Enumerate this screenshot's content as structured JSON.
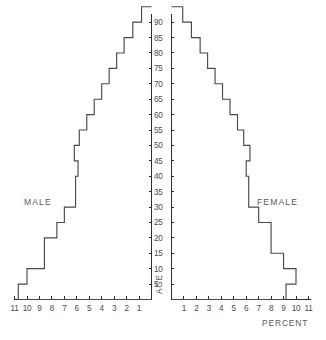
{
  "chart_data": {
    "type": "bar",
    "subtype": "population-pyramid",
    "title": "",
    "xlabel": "PERCENT",
    "ylabel": "AGE",
    "orientation": "horizontal-back-to-back",
    "grid": false,
    "legend_position": "inline-sides",
    "categories": [
      "0-4",
      "5-9",
      "10-14",
      "15-19",
      "20-24",
      "25-29",
      "30-34",
      "35-39",
      "40-44",
      "45-49",
      "50-54",
      "55-59",
      "60-64",
      "65-69",
      "70-74",
      "75-79",
      "80-84",
      "85-89",
      "90+"
    ],
    "age_band_lower_bounds": [
      0,
      5,
      10,
      15,
      20,
      25,
      30,
      35,
      40,
      45,
      50,
      55,
      60,
      65,
      70,
      75,
      80,
      85,
      90
    ],
    "series": [
      {
        "name": "MALE",
        "side": "left",
        "values": [
          10.7,
          10.0,
          8.6,
          8.6,
          7.6,
          7.0,
          6.1,
          6.1,
          5.9,
          6.2,
          5.8,
          5.2,
          4.6,
          4.0,
          3.4,
          2.8,
          2.2,
          1.5,
          0.8
        ]
      },
      {
        "name": "FEMALE",
        "side": "right",
        "values": [
          9.2,
          10.0,
          9.0,
          8.0,
          8.0,
          7.0,
          6.2,
          6.2,
          6.0,
          6.3,
          5.8,
          5.3,
          4.7,
          4.1,
          3.5,
          2.9,
          2.3,
          1.6,
          0.9
        ]
      }
    ],
    "x_tick_labels_left": [
      "11",
      "10",
      "9",
      "8",
      "7",
      "6",
      "5",
      "4",
      "3",
      "2",
      "1"
    ],
    "x_tick_values_left": [
      11,
      10,
      9,
      8,
      7,
      6,
      5,
      4,
      3,
      2,
      1
    ],
    "x_tick_labels_right": [
      "1",
      "2",
      "3",
      "4",
      "5",
      "6",
      "7",
      "8",
      "9",
      "10",
      "11"
    ],
    "x_tick_values_right": [
      1,
      2,
      3,
      4,
      5,
      6,
      7,
      8,
      9,
      10,
      11
    ],
    "xlim": [
      0,
      11.5
    ],
    "y_tick_labels": [
      "90",
      "85",
      "80",
      "75",
      "70",
      "65",
      "60",
      "55",
      "50",
      "45",
      "40",
      "35",
      "30",
      "25",
      "20",
      "15",
      "10",
      "5"
    ],
    "y_tick_values": [
      90,
      85,
      80,
      75,
      70,
      65,
      60,
      55,
      50,
      45,
      40,
      35,
      30,
      25,
      20,
      15,
      10,
      5
    ],
    "ylim": [
      0,
      92
    ],
    "colors": {
      "axis": "#2e2e2e",
      "outline": "#4a4a4a",
      "text": "#4c4c4c",
      "background": "#ffffff"
    }
  },
  "labels": {
    "male": "MALE",
    "female": "FEMALE",
    "age_axis_title": "AGE",
    "percent_axis_title": "PERCENT"
  }
}
